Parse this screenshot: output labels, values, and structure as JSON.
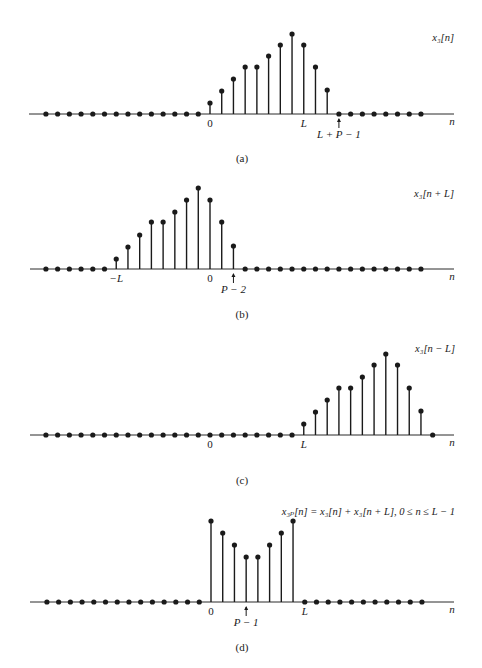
{
  "figure": {
    "colors": {
      "ink": "#1a1a1a",
      "axis": "#2a2a2a",
      "background": "#ffffff"
    },
    "spacing": 11.72,
    "dot_radius": 2.6,
    "panels": [
      {
        "id": "a",
        "caption": "(a)",
        "axis_y": 114,
        "axis_x_start": 29,
        "axis_x_end": 454,
        "origin_x": 210,
        "n_label": "n",
        "signal_label": "x₃[n]",
        "signal_label_x": 454,
        "signal_label_y": 41,
        "caption_y": 162,
        "first_index": -14,
        "last_index": 18,
        "stems": [
          {
            "n": 0,
            "top": 103
          },
          {
            "n": 1,
            "top": 91
          },
          {
            "n": 2,
            "top": 79
          },
          {
            "n": 3,
            "top": 67
          },
          {
            "n": 4,
            "top": 67
          },
          {
            "n": 5,
            "top": 56
          },
          {
            "n": 6,
            "top": 45
          },
          {
            "n": 7,
            "top": 34
          },
          {
            "n": 8,
            "top": 45
          },
          {
            "n": 9,
            "top": 67
          },
          {
            "n": 10,
            "top": 90
          }
        ],
        "tick_labels": [
          {
            "n": 0,
            "text": "0",
            "dy": 13
          },
          {
            "n": 8,
            "text": "L",
            "dy": 13,
            "italic": true
          }
        ],
        "arrow_labels": [
          {
            "n": 11,
            "text": "L + P − 1",
            "dy": 24,
            "italic": true
          }
        ]
      },
      {
        "id": "b",
        "caption": "(b)",
        "axis_y": 269,
        "axis_x_start": 30,
        "axis_x_end": 454,
        "origin_x": 210,
        "n_label": "n",
        "signal_label": "x₃[n + L]",
        "signal_label_x": 454,
        "signal_label_y": 197,
        "caption_y": 318,
        "first_index": -14,
        "last_index": 18,
        "stems": [
          {
            "n": -8,
            "top": 259
          },
          {
            "n": -7,
            "top": 247
          },
          {
            "n": -6,
            "top": 235
          },
          {
            "n": -5,
            "top": 222
          },
          {
            "n": -4,
            "top": 222
          },
          {
            "n": -3,
            "top": 212
          },
          {
            "n": -2,
            "top": 200
          },
          {
            "n": -1,
            "top": 188
          },
          {
            "n": 0,
            "top": 200
          },
          {
            "n": 1,
            "top": 222
          },
          {
            "n": 2,
            "top": 246
          }
        ],
        "tick_labels": [
          {
            "n": -8,
            "text": "−L",
            "dy": 13,
            "italic": true
          },
          {
            "n": 0,
            "text": "0",
            "dy": 13
          }
        ],
        "arrow_labels": [
          {
            "n": 2,
            "text": "P − 2",
            "dy": 24,
            "italic": true
          }
        ]
      },
      {
        "id": "c",
        "caption": "(c)",
        "axis_y": 435,
        "axis_x_start": 30,
        "axis_x_end": 454,
        "origin_x": 210,
        "n_label": "n",
        "signal_label": "x₃[n − L]",
        "signal_label_x": 455,
        "signal_label_y": 352,
        "caption_y": 484,
        "first_index": -14,
        "last_index": 19,
        "stems": [
          {
            "n": 8,
            "top": 424
          },
          {
            "n": 9,
            "top": 412
          },
          {
            "n": 10,
            "top": 400
          },
          {
            "n": 11,
            "top": 388
          },
          {
            "n": 12,
            "top": 388
          },
          {
            "n": 13,
            "top": 377
          },
          {
            "n": 14,
            "top": 365
          },
          {
            "n": 15,
            "top": 354
          },
          {
            "n": 16,
            "top": 365
          },
          {
            "n": 17,
            "top": 388
          },
          {
            "n": 18,
            "top": 411
          }
        ],
        "tick_labels": [
          {
            "n": 0,
            "text": "0",
            "dy": 13
          },
          {
            "n": 8,
            "text": "L",
            "dy": 13,
            "italic": true
          }
        ],
        "arrow_labels": []
      },
      {
        "id": "d",
        "caption": "(d)",
        "axis_y": 602,
        "axis_x_start": 30,
        "axis_x_end": 454,
        "origin_x": 211,
        "n_label": "n",
        "signal_label": "x₃ₚ[n] = x₃[n]  +  x₃[n + L], 0 ≤ n ≤ L − 1",
        "signal_label_x": 455,
        "signal_label_y": 515,
        "caption_y": 651,
        "first_index": -14,
        "last_index": 18,
        "stems": [
          {
            "n": 0,
            "top": 521
          },
          {
            "n": 1,
            "top": 533
          },
          {
            "n": 2,
            "top": 545
          },
          {
            "n": 3,
            "top": 557
          },
          {
            "n": 4,
            "top": 557
          },
          {
            "n": 5,
            "top": 545
          },
          {
            "n": 6,
            "top": 533
          },
          {
            "n": 7,
            "top": 521
          }
        ],
        "tick_labels": [
          {
            "n": 0,
            "text": "0",
            "dy": 13
          },
          {
            "n": 8,
            "text": "L",
            "dy": 13,
            "italic": true
          }
        ],
        "arrow_labels": [
          {
            "n": 3,
            "text": "P − 1",
            "dy": 24,
            "italic": true
          }
        ]
      }
    ]
  }
}
